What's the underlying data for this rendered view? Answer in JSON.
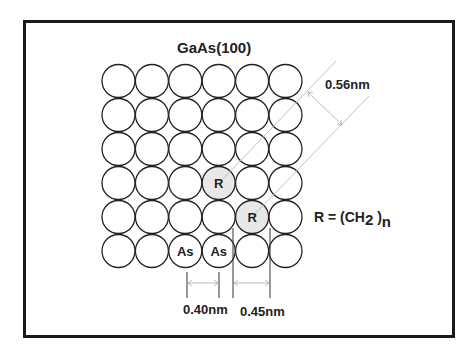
{
  "diagram": {
    "title": "GaAs(100)",
    "grid": {
      "rows": 6,
      "cols": 6,
      "origin_x": 102,
      "origin_y": 64,
      "step_x": 33.4,
      "step_y": 34,
      "radius": 16.5,
      "stroke": "#222222",
      "fill": "#ffffff",
      "highlight_fill": "#e8e8e8"
    },
    "special_atoms": [
      {
        "row": 3,
        "col": 3,
        "label": "R",
        "highlight": true
      },
      {
        "row": 4,
        "col": 4,
        "label": "R",
        "highlight": true
      },
      {
        "row": 5,
        "col": 2,
        "label": "As",
        "highlight": false
      },
      {
        "row": 5,
        "col": 3,
        "label": "As",
        "highlight": false
      }
    ],
    "chain_lines": [
      {
        "x1": 219,
        "y1": 183,
        "x2": 336,
        "y2": 61
      },
      {
        "x1": 252,
        "y1": 217,
        "x2": 369,
        "y2": 96
      }
    ],
    "measurements": {
      "chain_spacing": {
        "label": "0.56nm"
      },
      "as_spacing": {
        "label": "0.40nm"
      },
      "r_spacing": {
        "label": "0.45nm"
      }
    },
    "formula": {
      "prefix": "R = (CH",
      "subscript": "2",
      "middle": " )",
      "suffix_sub": "n"
    },
    "colors": {
      "frame": "#1a1a1a",
      "text": "#222222",
      "guide_line": "#bbbbbb"
    }
  }
}
